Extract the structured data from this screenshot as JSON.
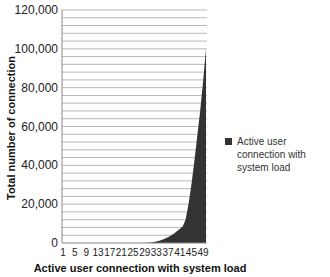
{
  "chart_data": {
    "type": "area",
    "title": "",
    "xlabel": "Active user connection with system load",
    "ylabel": "Total number of connection",
    "ylim": [
      0,
      120000
    ],
    "yticks": [
      0,
      20000,
      40000,
      60000,
      80000,
      100000,
      120000
    ],
    "ytick_labels": [
      "0",
      "20,000",
      "40,000",
      "60,000",
      "80,000",
      "100,000",
      "120,000"
    ],
    "minor_grid_step": 4000,
    "grid": true,
    "legend_position": "right",
    "xtick_labels": [
      "1",
      "5",
      "9",
      "13",
      "17",
      "21",
      "25",
      "29",
      "33",
      "37",
      "41",
      "45",
      "49"
    ],
    "x": [
      1,
      2,
      3,
      4,
      5,
      6,
      7,
      8,
      9,
      10,
      11,
      12,
      13,
      14,
      15,
      16,
      17,
      18,
      19,
      20,
      21,
      22,
      23,
      24,
      25,
      26,
      27,
      28,
      29,
      30,
      31,
      32,
      33,
      34,
      35,
      36,
      37,
      38,
      39,
      40,
      41,
      42,
      43,
      44,
      45,
      46,
      47,
      48,
      49,
      50
    ],
    "series": [
      {
        "name": "Active user connection with system load",
        "color": "#333333",
        "values": [
          0,
          0,
          0,
          0,
          0,
          0,
          0,
          0,
          0,
          0,
          0,
          0,
          0,
          0,
          0,
          0,
          0,
          0,
          0,
          0,
          0,
          0,
          0,
          0,
          0,
          0,
          0,
          0,
          50,
          150,
          300,
          500,
          800,
          1200,
          1700,
          2300,
          3000,
          3800,
          4800,
          6000,
          7200,
          8500,
          12000,
          20000,
          30000,
          42000,
          55000,
          68000,
          83000,
          100000
        ]
      }
    ]
  },
  "legend": {
    "items": [
      {
        "label": "Active user connection with system load",
        "color": "#333333"
      }
    ]
  }
}
